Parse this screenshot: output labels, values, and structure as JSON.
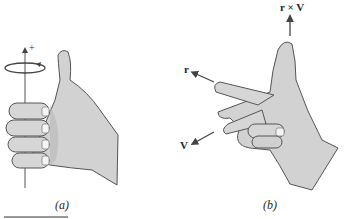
{
  "figure": {
    "panels": [
      {
        "id": "a",
        "caption": "(a)",
        "axis_sign": "+",
        "description": "Right hand with curled fingers around a vertical axis, thumb pointing up along + direction; rotation arrow circling axis"
      },
      {
        "id": "b",
        "caption": "(b)",
        "labels": {
          "index": "r",
          "middle": "V",
          "thumb": "r × V"
        },
        "description": "Right hand with index finger along r, middle finger along V, thumb pointing along r × V"
      }
    ],
    "colors": {
      "skin": "#d4d4d4",
      "skin_shadow": "#b8b8b8",
      "outline": "#555555",
      "arrow": "#444444",
      "text": "#2a2a2a"
    }
  }
}
